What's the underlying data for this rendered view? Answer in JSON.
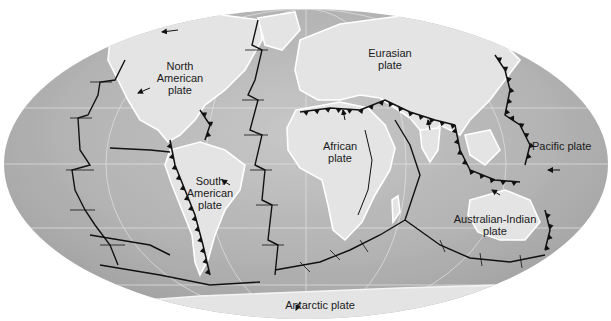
{
  "map": {
    "title": "World tectonic plates",
    "projection": "Mollweide (oval)",
    "colors": {
      "ocean": "#b4b4b4",
      "ocean_light": "#d2d2d2",
      "land": "#e8e8e8",
      "coast_highlight": "#ffffff",
      "boundary": "#111111",
      "graticule": "#e6e6e6",
      "background": "#ffffff"
    },
    "legend_symbols": {
      "subduction_zone": "line with triangular teeth",
      "spreading_ridge": "offset line segments with transform faults",
      "plate_motion": "arrow"
    },
    "plates": [
      {
        "id": "north-american",
        "label": "North\nAmerican\nplate"
      },
      {
        "id": "eurasian",
        "label": "Eurasian\nplate"
      },
      {
        "id": "pacific",
        "label": "Pacific plate"
      },
      {
        "id": "south-american",
        "label": "South\nAmerican\nplate"
      },
      {
        "id": "african",
        "label": "African\nplate"
      },
      {
        "id": "australian-indian",
        "label": "Australian-Indian\nplate"
      },
      {
        "id": "antarctic",
        "label": "Antarctic plate"
      }
    ]
  }
}
